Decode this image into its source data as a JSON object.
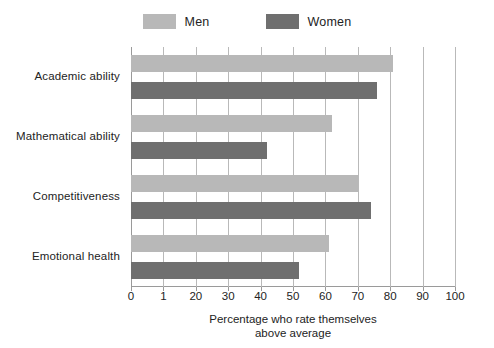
{
  "chart_data": {
    "type": "bar",
    "orientation": "horizontal",
    "title": "",
    "xlabel": "Percentage who rate themselves above average",
    "xlabel_lines": [
      "Percentage who rate themselves",
      "above average"
    ],
    "ylabel": "",
    "categories": [
      "Academic ability",
      "Mathematical ability",
      "Competitiveness",
      "Emotional health"
    ],
    "series": [
      {
        "name": "Men",
        "color": "#b8b8b8",
        "values": [
          81,
          62,
          70,
          61
        ]
      },
      {
        "name": "Women",
        "color": "#6f6f6f",
        "values": [
          76,
          42,
          74,
          52
        ]
      }
    ],
    "xlim": [
      0,
      100
    ],
    "xticks": [
      0,
      10,
      20,
      30,
      40,
      50,
      60,
      70,
      80,
      90,
      100
    ],
    "xtick_labels": [
      "0",
      "1",
      "20",
      "30",
      "40",
      "50",
      "60",
      "70",
      "80",
      "90",
      "100"
    ],
    "grid": "vertical",
    "legend_position": "top-center"
  },
  "legend": {
    "entries": [
      {
        "label": "Men",
        "color": "#b8b8b8"
      },
      {
        "label": "Women",
        "color": "#6f6f6f"
      }
    ]
  },
  "colors": {
    "men": "#b8b8b8",
    "women": "#6f6f6f",
    "gridline": "#b9b9b9",
    "axis": "#9a9a9a",
    "text": "#232323",
    "background": "#ffffff"
  }
}
